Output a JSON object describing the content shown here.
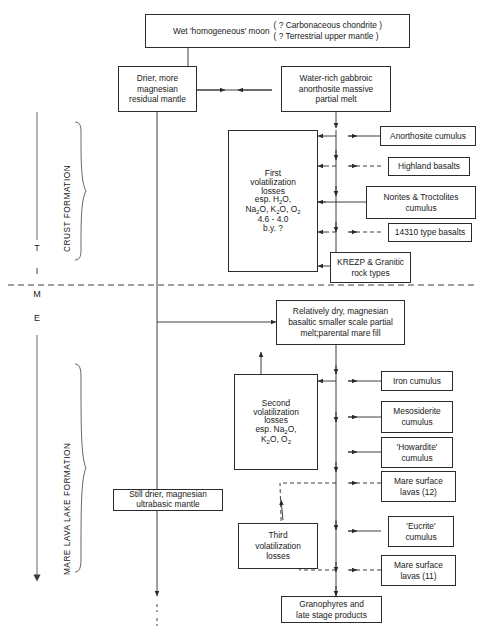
{
  "diagram": {
    "time_axis": {
      "letters": [
        "T",
        "I",
        "M",
        "E"
      ],
      "direction": "downward"
    },
    "section_labels": {
      "upper": "CRUST FORMATION",
      "lower": "MARE LAVA LAKE FORMATION"
    },
    "colors": {
      "line": "#2b2b2b",
      "text": "#1a1a1a",
      "background": "#ffffff"
    }
  },
  "boxes": {
    "source_moon": {
      "left_text": "Wet 'homogeneous' moon",
      "right_line1": "( ? Carbonaceous chondrite )",
      "right_line2": "( ? Terrestrial upper mantle )"
    },
    "drier_mantle": {
      "line1": "Drier, more",
      "line2": "magnesian",
      "line3": "residual mantle"
    },
    "water_rich_melt": {
      "line1": "Water-rich gabbroic",
      "line2": "anorthosite massive",
      "line3": "partial melt"
    },
    "first_volatilization": {
      "line1": "First",
      "line2": "volatilization",
      "line3": "losses",
      "line4": "esp. H2O,",
      "line5": "Na2O, K2O, O2",
      "line6": "4.6 - 4.0",
      "line7": "b.y. ?"
    },
    "anorthosite_cumulus": {
      "line1": "Anorthosite cumulus"
    },
    "highland_basalts": {
      "line1": "Highland basalts"
    },
    "norites_troctolites": {
      "line1": "Norites & Troctolites",
      "line2": "cumulus"
    },
    "basalts_14310": {
      "line1": "14310 type basalts"
    },
    "krezp_granitic": {
      "line1": "KREZP & Granitic",
      "line2": "rock types"
    },
    "relatively_dry_melt": {
      "line1": "Relatively dry, magnesian",
      "line2": "basaltic smaller scale partial",
      "line3": "melt;parental mare fill"
    },
    "second_volatilization": {
      "line1": "Second",
      "line2": "volatilization",
      "line3": "losses",
      "line4": "esp. Na2O,",
      "line5": "K2O, O2"
    },
    "iron_cumulus": {
      "line1": "Iron cumulus"
    },
    "mesosiderite_cumulus": {
      "line1": "Mesosiderite",
      "line2": "cumulus"
    },
    "howardite_cumulus": {
      "line1": "'Howardite'",
      "line2": "cumulus"
    },
    "mare_lavas_12": {
      "line1": "Mare surface",
      "line2": "lavas  (12)"
    },
    "eucrite_cumulus": {
      "line1": "'Eucrite'",
      "line2": "cumulus"
    },
    "mare_lavas_11": {
      "line1": "Mare surface",
      "line2": "lavas  (11)"
    },
    "still_drier_mantle": {
      "line1": "Still drier, magnesian",
      "line2": "ultrabasic mantle"
    },
    "third_volatilization": {
      "line1": "Third",
      "line2": "volatilization",
      "line3": "losses"
    },
    "granophyres": {
      "line1": "Granophyres and",
      "line2": "late stage products"
    }
  }
}
